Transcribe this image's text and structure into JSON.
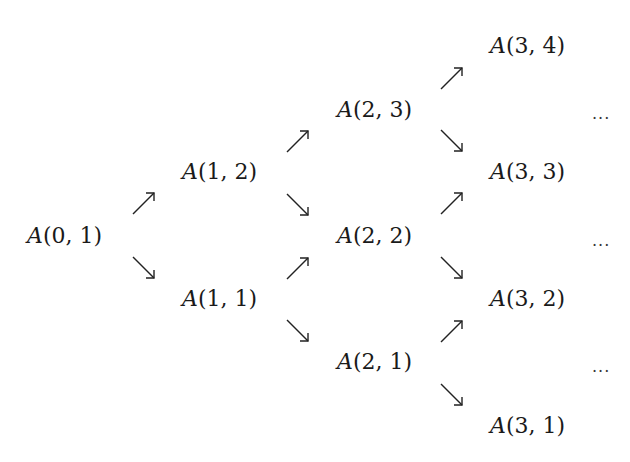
{
  "diagram": {
    "type": "recursion-tree",
    "clipped_top_text": "",
    "nodes": [
      {
        "id": "n01",
        "fn": "A",
        "args": "(0, 1)",
        "x": 27,
        "y": 222
      },
      {
        "id": "n12",
        "fn": "A",
        "args": "(1, 2)",
        "x": 182,
        "y": 158
      },
      {
        "id": "n11",
        "fn": "A",
        "args": "(1, 1)",
        "x": 182,
        "y": 285
      },
      {
        "id": "n23",
        "fn": "A",
        "args": "(2, 3)",
        "x": 337,
        "y": 96
      },
      {
        "id": "n22",
        "fn": "A",
        "args": "(2, 2)",
        "x": 337,
        "y": 222
      },
      {
        "id": "n21",
        "fn": "A",
        "args": "(2, 1)",
        "x": 337,
        "y": 348
      },
      {
        "id": "n34",
        "fn": "A",
        "args": "(3, 4)",
        "x": 490,
        "y": 32
      },
      {
        "id": "n33",
        "fn": "A",
        "args": "(3, 3)",
        "x": 490,
        "y": 158
      },
      {
        "id": "n32",
        "fn": "A",
        "args": "(3, 2)",
        "x": 490,
        "y": 285
      },
      {
        "id": "n31",
        "fn": "A",
        "args": "(3, 1)",
        "x": 490,
        "y": 412
      }
    ],
    "arrows": [
      {
        "dir": "up",
        "x": 131,
        "y": 190
      },
      {
        "dir": "down",
        "x": 131,
        "y": 255
      },
      {
        "dir": "up",
        "x": 285,
        "y": 128
      },
      {
        "dir": "down",
        "x": 285,
        "y": 192
      },
      {
        "dir": "up",
        "x": 285,
        "y": 255
      },
      {
        "dir": "down",
        "x": 285,
        "y": 318
      },
      {
        "dir": "up",
        "x": 439,
        "y": 65
      },
      {
        "dir": "down",
        "x": 439,
        "y": 128
      },
      {
        "dir": "up",
        "x": 439,
        "y": 190
      },
      {
        "dir": "down",
        "x": 439,
        "y": 255
      },
      {
        "dir": "up",
        "x": 439,
        "y": 318
      },
      {
        "dir": "down",
        "x": 439,
        "y": 382
      }
    ],
    "continuations": [
      {
        "text": "...",
        "x": 592,
        "y": 109
      },
      {
        "text": "...",
        "x": 592,
        "y": 236
      },
      {
        "text": "...",
        "x": 592,
        "y": 362
      }
    ]
  }
}
